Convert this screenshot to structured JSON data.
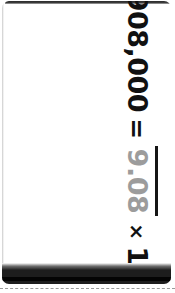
{
  "card": {
    "equation": {
      "left_value": "908,000",
      "equals": "=",
      "coefficient": "9.08",
      "times": "×",
      "base": "10",
      "exponent": "5",
      "full_text": "908,000 = 9.08 × 10⁵"
    },
    "copyright": "© Carson Dellosa",
    "colors": {
      "card_background": "#ffffff",
      "ink": "#111111",
      "coefficient_ink": "#9c9c9c",
      "copyright_ink": "#8d8d8d",
      "edge_band": "#1d1d1d",
      "cut_line": "#9a9a9a"
    }
  }
}
